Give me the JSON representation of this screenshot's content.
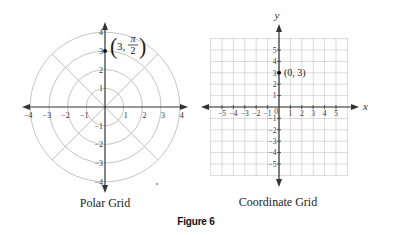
{
  "figure": {
    "label": "Figure 6"
  },
  "polar_grid": {
    "caption": "Polar Grid",
    "center": [
      105,
      107
    ],
    "unit_px": 18.7,
    "circle_radii": [
      1,
      2,
      3,
      4
    ],
    "radial_angles_deg": [
      45,
      135
    ],
    "axis_ticks_x": [
      "-4",
      "-3",
      "-2",
      "-1",
      "1",
      "2",
      "3",
      "4"
    ],
    "axis_ticks_y": [
      "4",
      "3",
      "2",
      "1",
      "-1",
      "-2",
      "-3",
      "-4"
    ],
    "point": {
      "r": 3,
      "theta": "π/2",
      "label_r": "3",
      "label_theta_num": "π",
      "label_theta_den": "2"
    },
    "colors": {
      "grid": "#b4b4b4",
      "axis": "#333333"
    }
  },
  "coordinate_grid": {
    "caption": "Coordinate Grid",
    "origin": [
      279,
      107
    ],
    "unit_px": 11.4,
    "x_range": [
      -6,
      6
    ],
    "y_range": [
      -6,
      6
    ],
    "x_axis_label": "x",
    "y_axis_label": "y",
    "origin_label": "0",
    "axis_ticks_x": [
      "-5",
      "-4",
      "-3",
      "-2",
      "-1",
      "1",
      "2",
      "3",
      "4",
      "5"
    ],
    "axis_ticks_y": [
      "5",
      "4",
      "3",
      "2",
      "1",
      "-1",
      "-2",
      "-3",
      "-4",
      "-5"
    ],
    "point": {
      "x": 0,
      "y": 3,
      "label": "(0, 3)"
    },
    "colors": {
      "grid": "#9a9a9a",
      "axis": "#333333"
    }
  }
}
